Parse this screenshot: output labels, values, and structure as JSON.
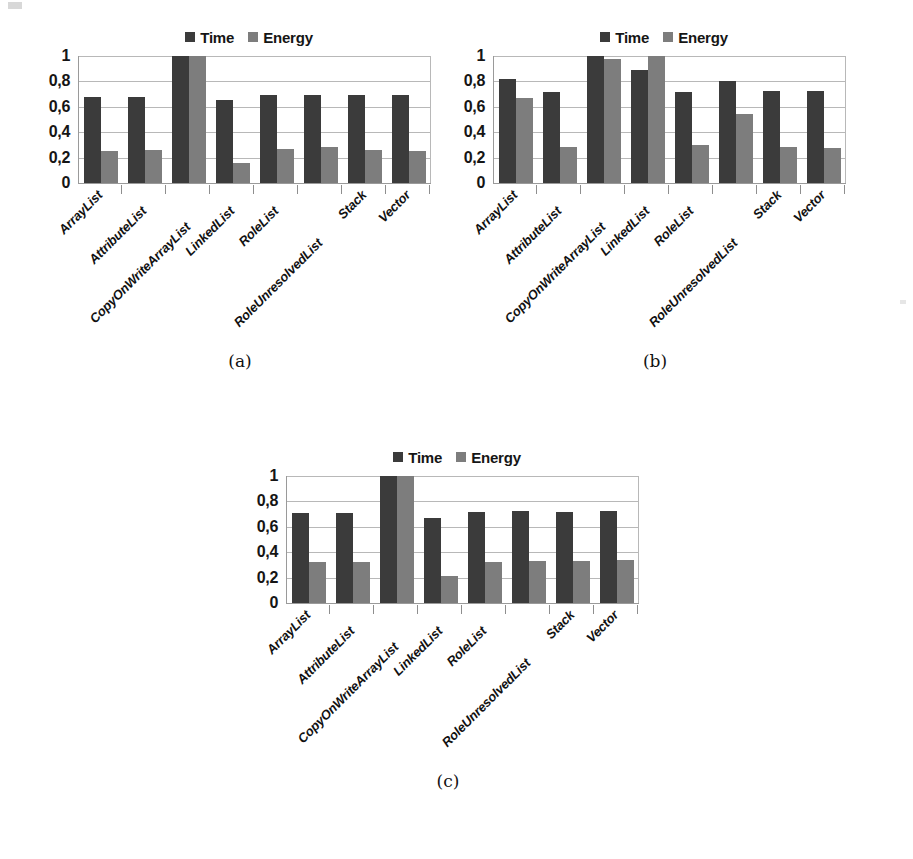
{
  "figure": {
    "legend": [
      {
        "name": "Time",
        "color": "#3b3b3b"
      },
      {
        "name": "Energy",
        "color": "#7d7d7d"
      }
    ],
    "categories": [
      "ArrayList",
      "AttributeList",
      "CopyOnWriteArrayList",
      "LinkedList",
      "RoleList",
      "RoleUnresolvedList",
      "Stack",
      "Vector"
    ],
    "yticks": [
      "1",
      "0,8",
      "0,6",
      "0,4",
      "0,2",
      "0"
    ],
    "captions": {
      "a": "(a)",
      "b": "(b)",
      "c": "(c)"
    }
  },
  "chart_data": [
    {
      "type": "bar",
      "title": "(a)",
      "categories": [
        "ArrayList",
        "AttributeList",
        "CopyOnWriteArrayList",
        "LinkedList",
        "RoleList",
        "RoleUnresolvedList",
        "Stack",
        "Vector"
      ],
      "series": [
        {
          "name": "Time",
          "color": "#3b3b3b",
          "values": [
            0.68,
            0.68,
            1.0,
            0.65,
            0.69,
            0.69,
            0.69,
            0.69
          ]
        },
        {
          "name": "Energy",
          "color": "#7d7d7d",
          "values": [
            0.25,
            0.26,
            1.0,
            0.16,
            0.27,
            0.28,
            0.26,
            0.25
          ]
        }
      ],
      "xlabel": "",
      "ylabel": "",
      "ylim": [
        0,
        1
      ],
      "ytick_labels": [
        "1",
        "0,8",
        "0,6",
        "0,4",
        "0,2",
        "0"
      ],
      "ytick_values": [
        1,
        0.8,
        0.6,
        0.4,
        0.2,
        0
      ],
      "grid": true,
      "legend_position": "top-center"
    },
    {
      "type": "bar",
      "title": "(b)",
      "categories": [
        "ArrayList",
        "AttributeList",
        "CopyOnWriteArrayList",
        "LinkedList",
        "RoleList",
        "RoleUnresolvedList",
        "Stack",
        "Vector"
      ],
      "series": [
        {
          "name": "Time",
          "color": "#3b3b3b",
          "values": [
            0.82,
            0.72,
            1.0,
            0.89,
            0.72,
            0.8,
            0.725,
            0.725
          ]
        },
        {
          "name": "Energy",
          "color": "#7d7d7d",
          "values": [
            0.67,
            0.28,
            0.98,
            1.0,
            0.3,
            0.54,
            0.285,
            0.275
          ]
        }
      ],
      "xlabel": "",
      "ylabel": "",
      "ylim": [
        0,
        1
      ],
      "ytick_labels": [
        "1",
        "0,8",
        "0,6",
        "0,4",
        "0,2",
        "0"
      ],
      "ytick_values": [
        1,
        0.8,
        0.6,
        0.4,
        0.2,
        0
      ],
      "grid": true,
      "legend_position": "top-center"
    },
    {
      "type": "bar",
      "title": "(c)",
      "categories": [
        "ArrayList",
        "AttributeList",
        "CopyOnWriteArrayList",
        "LinkedList",
        "RoleList",
        "RoleUnresolvedList",
        "Stack",
        "Vector"
      ],
      "series": [
        {
          "name": "Time",
          "color": "#3b3b3b",
          "values": [
            0.71,
            0.71,
            1.0,
            0.67,
            0.72,
            0.725,
            0.72,
            0.725
          ]
        },
        {
          "name": "Energy",
          "color": "#7d7d7d",
          "values": [
            0.32,
            0.32,
            1.0,
            0.21,
            0.32,
            0.33,
            0.33,
            0.34
          ]
        }
      ],
      "xlabel": "",
      "ylabel": "",
      "ylim": [
        0,
        1
      ],
      "ytick_labels": [
        "1",
        "0,8",
        "0,6",
        "0,4",
        "0,2",
        "0"
      ],
      "ytick_values": [
        1,
        0.8,
        0.6,
        0.4,
        0.2,
        0
      ],
      "grid": true,
      "legend_position": "top-center"
    }
  ]
}
